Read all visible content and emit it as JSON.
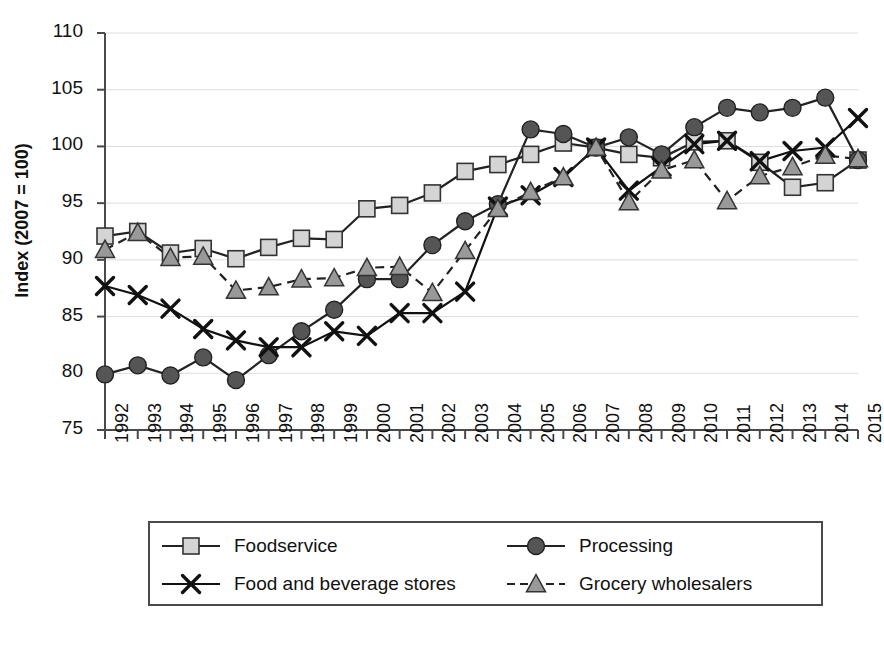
{
  "chart_data": {
    "type": "line",
    "title": "",
    "xlabel": "",
    "ylabel": "Index (2007 = 100)",
    "ylim": [
      75,
      110
    ],
    "ytick_values": [
      75,
      80,
      85,
      90,
      95,
      100,
      105,
      110
    ],
    "ytick_labels": [
      "75",
      "80",
      "85",
      "90",
      "95",
      "100",
      "105",
      "110"
    ],
    "grid": true,
    "grid_axis": "y",
    "legend_position": "bottom",
    "categories": [
      "1992",
      "1993",
      "1994",
      "1995",
      "1996",
      "1997",
      "1998",
      "1999",
      "2000",
      "2001",
      "2002",
      "2003",
      "2004",
      "2005",
      "2006",
      "2007",
      "2008",
      "2009",
      "2010",
      "2011",
      "2012",
      "2013",
      "2014",
      "2015"
    ],
    "x": [
      1992,
      1993,
      1994,
      1995,
      1996,
      1997,
      1998,
      1999,
      2000,
      2001,
      2002,
      2003,
      2004,
      2005,
      2006,
      2007,
      2008,
      2009,
      2010,
      2011,
      2012,
      2013,
      2014,
      2015
    ],
    "series": [
      {
        "name": "Foodservice",
        "marker": "square",
        "linestyle": "solid",
        "marker_fill": "#d4d4d4",
        "line_color": "#222222",
        "values": [
          92.1,
          92.5,
          90.6,
          91.0,
          90.1,
          91.1,
          91.9,
          91.8,
          94.5,
          94.8,
          95.9,
          97.8,
          98.4,
          99.3,
          100.3,
          99.9,
          99.3,
          99.0,
          100.4,
          100.5,
          98.6,
          96.4,
          96.8,
          98.8
        ]
      },
      {
        "name": "Processing",
        "marker": "circle",
        "linestyle": "solid",
        "marker_fill": "#555555",
        "line_color": "#222222",
        "values": [
          79.9,
          80.7,
          79.8,
          81.4,
          79.4,
          81.6,
          83.7,
          85.6,
          88.3,
          88.3,
          91.3,
          93.4,
          94.9,
          101.5,
          101.1,
          99.9,
          100.8,
          99.3,
          101.7,
          103.4,
          103.0,
          103.4,
          104.3,
          98.8
        ]
      },
      {
        "name": "Food and beverage stores",
        "marker": "x",
        "linestyle": "solid",
        "marker_fill": "#111111",
        "line_color": "#111111",
        "values": [
          87.7,
          86.9,
          85.7,
          83.9,
          82.9,
          82.3,
          82.3,
          83.7,
          83.3,
          85.3,
          85.3,
          87.2,
          94.7,
          95.7,
          97.3,
          99.9,
          96.1,
          98.2,
          100.2,
          100.5,
          98.7,
          99.6,
          99.9,
          102.5
        ]
      },
      {
        "name": "Grocery wholesalers",
        "marker": "triangle",
        "linestyle": "dashed",
        "marker_fill": "#999999",
        "line_color": "#222222",
        "values": [
          90.9,
          92.4,
          90.2,
          90.3,
          87.3,
          87.6,
          88.3,
          88.4,
          89.3,
          89.4,
          87.1,
          90.8,
          94.5,
          96.0,
          97.3,
          99.9,
          95.1,
          97.9,
          98.8,
          95.2,
          97.4,
          98.2,
          99.2,
          98.9
        ]
      }
    ]
  },
  "legend": {
    "items": [
      {
        "label": "Foodservice",
        "marker": "square",
        "linestyle": "solid"
      },
      {
        "label": "Processing",
        "marker": "circle",
        "linestyle": "solid"
      },
      {
        "label": "Food and beverage stores",
        "marker": "x",
        "linestyle": "solid"
      },
      {
        "label": "Grocery wholesalers",
        "marker": "triangle",
        "linestyle": "dashed"
      }
    ]
  },
  "colors": {
    "axis": "#4a4a4a",
    "grid": "#dcdcdc",
    "text": "#111111",
    "foodservice_fill": "#d4d4d4",
    "processing_fill": "#555555",
    "stores_stroke": "#111111",
    "wholesalers_fill": "#999999"
  }
}
